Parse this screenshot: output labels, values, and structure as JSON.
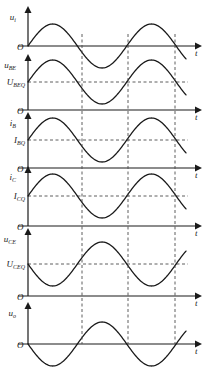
{
  "figure": {
    "axis_origin_label": "O",
    "time_axis_label": "t",
    "stroke_color": "#1a1a1a",
    "dashed_color": "#4d4d4d",
    "background": "#ffffff"
  },
  "plots": [
    {
      "id": "u-i",
      "y_label_main": "u",
      "y_label_sub": "i",
      "level_label_main": "",
      "level_label_sub": "",
      "origin": "O",
      "t_label": "t",
      "phase": "positive",
      "baseline": "zero"
    },
    {
      "id": "u-be",
      "y_label_main": "u",
      "y_label_sub": "BE",
      "level_label_main": "U",
      "level_label_sub": "BEQ",
      "origin": "O",
      "t_label": "t",
      "phase": "positive",
      "baseline": "offset"
    },
    {
      "id": "i-b",
      "y_label_main": "i",
      "y_label_sub": "B",
      "level_label_main": "I",
      "level_label_sub": "BQ",
      "origin": "O",
      "t_label": "t",
      "phase": "positive",
      "baseline": "offset"
    },
    {
      "id": "i-c",
      "y_label_main": "i",
      "y_label_sub": "C",
      "level_label_main": "I",
      "level_label_sub": "CQ",
      "origin": "O",
      "t_label": "t",
      "phase": "positive",
      "baseline": "offset"
    },
    {
      "id": "u-ce",
      "y_label_main": "u",
      "y_label_sub": "CE",
      "level_label_main": "U",
      "level_label_sub": "CEQ",
      "origin": "O",
      "t_label": "t",
      "phase": "inverted",
      "baseline": "offset"
    },
    {
      "id": "u-o",
      "y_label_main": "u",
      "y_label_sub": "o",
      "level_label_main": "",
      "level_label_sub": "",
      "origin": "O",
      "t_label": "t",
      "phase": "inverted",
      "baseline": "zero"
    }
  ],
  "chart_data": {
    "type": "line",
    "xlabel": "t",
    "ylabel": "",
    "grid": false,
    "legend": "none",
    "x_dashed_markers": [
      82,
      128,
      175
    ],
    "series": [
      {
        "name": "u_i",
        "offset": 0,
        "amplitude": 1,
        "phase_deg": 0,
        "cycles": 1.6,
        "description": "input voltage sine starting at zero rising"
      },
      {
        "name": "u_BE",
        "offset": 1,
        "amplitude": 1,
        "phase_deg": 0,
        "cycles": 1.6,
        "description": "base-emitter voltage riding on quiescent U_BEQ"
      },
      {
        "name": "i_B",
        "offset": 1,
        "amplitude": 1,
        "phase_deg": 0,
        "cycles": 1.6,
        "description": "base current riding on quiescent I_BQ"
      },
      {
        "name": "i_C",
        "offset": 1,
        "amplitude": 1,
        "phase_deg": 0,
        "cycles": 1.6,
        "description": "collector current riding on quiescent I_CQ"
      },
      {
        "name": "u_CE",
        "offset": 1,
        "amplitude": 1,
        "phase_deg": 180,
        "cycles": 1.6,
        "description": "collector-emitter voltage, inverted, riding on U_CEQ"
      },
      {
        "name": "u_o",
        "offset": 0,
        "amplitude": 1,
        "phase_deg": 180,
        "cycles": 1.6,
        "description": "output voltage, inverted relative to input"
      }
    ]
  }
}
